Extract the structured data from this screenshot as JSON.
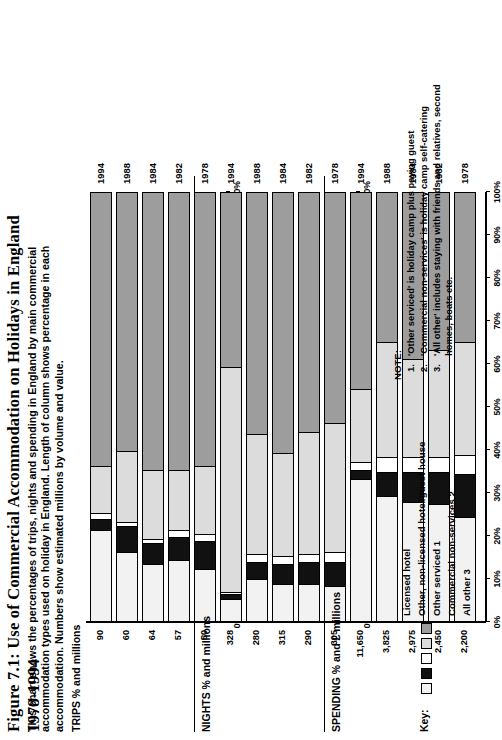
{
  "figure": {
    "title": "Figure 7.1: Use of Commercial Accommodation on Holidays in England 1978-1994",
    "subtitle": "This chart shows the percentages of trips, nights and spending in England by main commercial accommodation types used on holiday in England.  Length of column shows percentage in each accommodation.  Numbers show estimated millions by volume and value."
  },
  "key": {
    "label": "Key:",
    "items": [
      {
        "name": "Licensed hotel",
        "color": "#f2f2f2"
      },
      {
        "name": "Other, non-licensed hotel/guest house",
        "color": "#111111"
      },
      {
        "name": "Other serviced 1",
        "color": "#ffffff"
      },
      {
        "name": "Commercial non-services 2",
        "color": "#dcdcdc"
      },
      {
        "name": "All other 3",
        "color": "#9d9d9d"
      }
    ]
  },
  "note": {
    "title": "NOTE:",
    "items": [
      {
        "num": "1.",
        "text": "'Other serviced' is holiday camp plus paying guest"
      },
      {
        "num": "2.",
        "text": "'Commercial non-services' is holiday camp self-catering"
      },
      {
        "num": "3.",
        "text": "'All other' includes staying with friends and relatives, second homes, boats etc."
      }
    ]
  },
  "axis": {
    "ticklabels": [
      "0%",
      "10%",
      "20%",
      "30%",
      "40%",
      "50%",
      "60%",
      "70%",
      "80%",
      "90%",
      "100%"
    ],
    "min": 0,
    "max": 100
  },
  "chart_data": [
    {
      "type": "bar",
      "orientation": "horizontal",
      "stacked": true,
      "panel": "trips",
      "title": "TRIPS % and millions",
      "xlabel": "",
      "ylabel": "",
      "xlim": [
        0,
        100
      ],
      "grid": false,
      "legend_position": "bottom-right",
      "categories": [
        "1978",
        "1982",
        "1984",
        "1988",
        "1994"
      ],
      "value_labels": [
        "50",
        "57",
        "64",
        "60",
        "90"
      ],
      "series": [
        {
          "name": "Licensed hotel",
          "color": "#f2f2f2",
          "values": [
            12.0,
            14.0,
            13.0,
            16.0,
            21.0
          ]
        },
        {
          "name": "Other, non-licensed hotel/guest house",
          "color": "#111111",
          "values": [
            6.5,
            5.5,
            5.0,
            6.0,
            2.5
          ]
        },
        {
          "name": "Other serviced 1",
          "color": "#ffffff",
          "values": [
            1.5,
            1.5,
            1.0,
            1.0,
            1.5
          ]
        },
        {
          "name": "Commercial non-services 2",
          "color": "#dcdcdc",
          "values": [
            16.0,
            14.0,
            16.0,
            16.5,
            11.0
          ]
        },
        {
          "name": "All other 3",
          "color": "#9d9d9d",
          "values": [
            64.0,
            65.0,
            65.0,
            60.5,
            64.0
          ]
        }
      ]
    },
    {
      "type": "bar",
      "orientation": "horizontal",
      "stacked": true,
      "panel": "nights",
      "title": "NIGHTS % and millions",
      "xlabel": "",
      "ylabel": "",
      "xlim": [
        0,
        100
      ],
      "grid": false,
      "legend_position": "bottom-right",
      "categories": [
        "1978",
        "1982",
        "1984",
        "1988",
        "1994"
      ],
      "value_labels": [
        "305",
        "290",
        "315",
        "280",
        "328"
      ],
      "series": [
        {
          "name": "Licensed hotel",
          "color": "#f2f2f2",
          "values": [
            8.0,
            8.5,
            8.5,
            9.5,
            5.0
          ]
        },
        {
          "name": "Other, non-licensed hotel/guest house",
          "color": "#111111",
          "values": [
            5.5,
            5.0,
            4.5,
            4.0,
            1.0
          ]
        },
        {
          "name": "Other serviced 1",
          "color": "#ffffff",
          "values": [
            2.5,
            2.0,
            2.0,
            2.0,
            0.5
          ]
        },
        {
          "name": "Commercial non-services 2",
          "color": "#dcdcdc",
          "values": [
            30.0,
            28.5,
            24.0,
            28.0,
            52.5
          ]
        },
        {
          "name": "All other 3",
          "color": "#9d9d9d",
          "values": [
            54.0,
            56.0,
            61.0,
            56.5,
            41.0
          ]
        }
      ]
    },
    {
      "type": "bar",
      "orientation": "horizontal",
      "stacked": true,
      "panel": "spending",
      "title": "SPENDING % and £ millions",
      "xlabel": "",
      "ylabel": "",
      "xlim": [
        0,
        100
      ],
      "grid": false,
      "legend_position": "bottom-right",
      "categories": [
        "1978",
        "1982",
        "1984",
        "1988",
        "1994"
      ],
      "value_labels": [
        "2,200",
        "2,450",
        "2,975",
        "3,825",
        "11,650"
      ],
      "series": [
        {
          "name": "Licensed hotel",
          "color": "#f2f2f2",
          "values": [
            24.0,
            27.0,
            27.5,
            29.0,
            33.0
          ]
        },
        {
          "name": "Other, non-licensed hotel/guest house",
          "color": "#111111",
          "values": [
            10.0,
            7.5,
            7.0,
            5.5,
            2.0
          ]
        },
        {
          "name": "Other serviced 1",
          "color": "#ffffff",
          "values": [
            4.5,
            3.5,
            3.5,
            3.5,
            2.0
          ]
        },
        {
          "name": "Commercial non-services 2",
          "color": "#dcdcdc",
          "values": [
            26.5,
            25.0,
            23.0,
            27.0,
            17.0
          ]
        },
        {
          "name": "All other 3",
          "color": "#9d9d9d",
          "values": [
            35.0,
            37.0,
            39.0,
            35.0,
            46.0
          ]
        }
      ]
    }
  ]
}
